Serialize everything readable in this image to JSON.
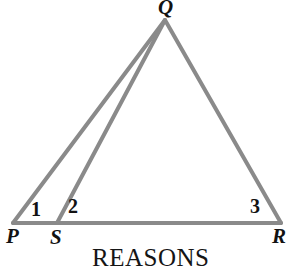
{
  "figure": {
    "type": "geometry-diagram",
    "background_color": "#ffffff",
    "stroke_color": "#8a8a8a",
    "stroke_width": 4,
    "text_color": "#121212",
    "points": {
      "P": {
        "x": 13,
        "y": 223
      },
      "Q": {
        "x": 165,
        "y": 20
      },
      "R": {
        "x": 281,
        "y": 223
      },
      "S": {
        "x": 57,
        "y": 223
      }
    },
    "segments": [
      {
        "name": "PQ",
        "from": "P",
        "to": "Q"
      },
      {
        "name": "QR",
        "from": "Q",
        "to": "R"
      },
      {
        "name": "PR",
        "from": "P",
        "to": "R"
      },
      {
        "name": "SQ",
        "from": "S",
        "to": "Q"
      }
    ],
    "vertex_labels": [
      {
        "id": "Q",
        "text": "Q"
      },
      {
        "id": "P",
        "text": "P"
      },
      {
        "id": "S",
        "text": "S"
      },
      {
        "id": "R",
        "text": "R"
      }
    ],
    "angle_labels": [
      {
        "id": "1",
        "text": "1",
        "at_vertex": "P"
      },
      {
        "id": "2",
        "text": "2",
        "at_vertex": "S"
      },
      {
        "id": "3",
        "text": "3",
        "at_vertex": "R"
      }
    ]
  },
  "caption": {
    "text": "REASONS"
  }
}
